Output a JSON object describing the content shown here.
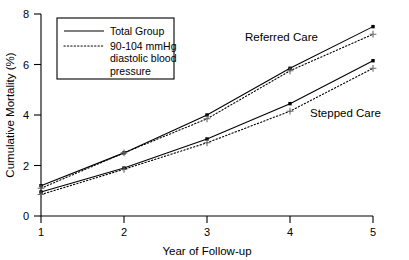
{
  "chart_data": {
    "type": "line",
    "title": "",
    "xlabel": "Year of Follow-up",
    "ylabel": "Cumulative Mortality (%)",
    "x": [
      1,
      2,
      3,
      4,
      5
    ],
    "xlim": [
      1,
      5
    ],
    "ylim": [
      0,
      8
    ],
    "xticks": [
      "1",
      "2",
      "3",
      "4",
      "5"
    ],
    "yticks": [
      "0",
      "2",
      "4",
      "6",
      "8"
    ],
    "grid": false,
    "legend_position": "top-left",
    "series": [
      {
        "name": "Referred Care — Total Group",
        "group": "Referred Care",
        "style": "solid",
        "marker": "square",
        "values": [
          1.2,
          2.5,
          4.0,
          5.85,
          7.5
        ]
      },
      {
        "name": "Referred Care — 90-104 mmHg diastolic blood pressure",
        "group": "Referred Care",
        "style": "dotted",
        "marker": "plus",
        "values": [
          1.1,
          2.5,
          3.85,
          5.75,
          7.2
        ]
      },
      {
        "name": "Stepped Care — Total Group",
        "group": "Stepped Care",
        "style": "solid",
        "marker": "square",
        "values": [
          0.95,
          1.9,
          3.05,
          4.45,
          6.15
        ]
      },
      {
        "name": "Stepped Care — 90-104 mmHg diastolic blood pressure",
        "group": "Stepped Care",
        "style": "dotted",
        "marker": "plus",
        "values": [
          0.85,
          1.85,
          2.9,
          4.15,
          5.85
        ]
      }
    ],
    "annotations": [
      {
        "text": "Referred Care",
        "x": 3.55,
        "y": 6.95
      },
      {
        "text": "Stepped Care",
        "x": 4.35,
        "y": 4.15
      }
    ]
  },
  "axes": {
    "y_title": "Cumulative Mortality (%)",
    "x_title": "Year of Follow-up",
    "y_tick_0": "0",
    "y_tick_1": "2",
    "y_tick_2": "4",
    "y_tick_3": "6",
    "y_tick_4": "8",
    "x_tick_0": "1",
    "x_tick_1": "2",
    "x_tick_2": "3",
    "x_tick_3": "4",
    "x_tick_4": "5"
  },
  "legend": {
    "entries": [
      {
        "label": "Total Group",
        "style": "solid"
      },
      {
        "label": "90-104 mmHg",
        "style": "dotted"
      },
      {
        "label": "diastolic blood",
        "style": "none"
      },
      {
        "label": "pressure",
        "style": "none"
      }
    ]
  },
  "annotations": {
    "referred_care": "Referred Care",
    "stepped_care": "Stepped Care"
  },
  "colors": {
    "line": "#000000",
    "marker_plus": "#6a6a6a",
    "background": "#ffffff"
  }
}
